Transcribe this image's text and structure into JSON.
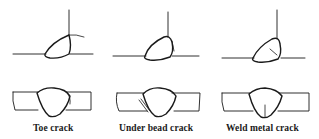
{
  "figure": {
    "panels": [
      {
        "id": "toe",
        "caption": "Toe crack"
      },
      {
        "id": "underbead",
        "caption": "Under bead crack"
      },
      {
        "id": "weld-metal",
        "caption": "Weld metal crack"
      }
    ],
    "colors": {
      "ink": "#1a1a1a",
      "background": "#ffffff"
    }
  }
}
